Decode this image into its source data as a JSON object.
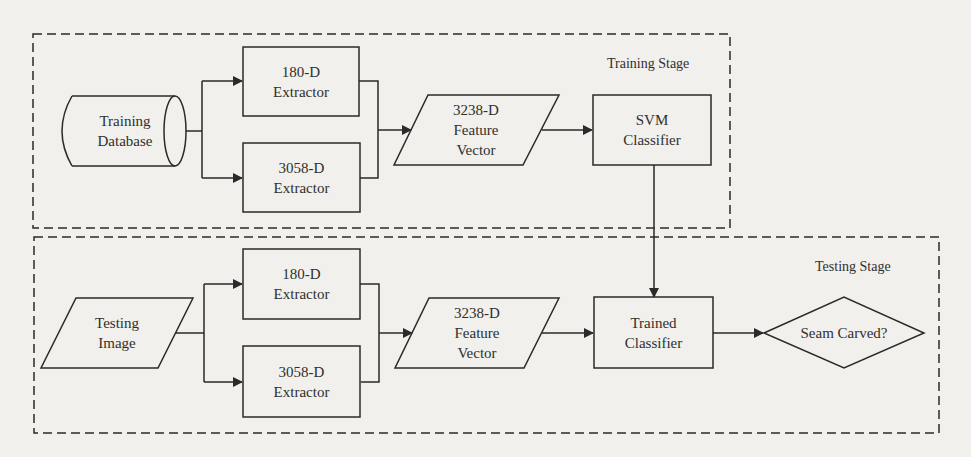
{
  "diagram": {
    "training_stage": {
      "title": "Training Stage",
      "nodes": {
        "database": {
          "line1": "Training",
          "line2": "Database",
          "shape": "cylinder"
        },
        "extractor_180": {
          "line1": "180-D",
          "line2": "Extractor",
          "shape": "rectangle"
        },
        "extractor_3058": {
          "line1": "3058-D",
          "line2": "Extractor",
          "shape": "rectangle"
        },
        "feature_vector": {
          "line1": "3238-D",
          "line2": "Feature",
          "line3": "Vector",
          "shape": "parallelogram"
        },
        "svm": {
          "line1": "SVM",
          "line2": "Classifier",
          "shape": "rectangle"
        }
      }
    },
    "testing_stage": {
      "title": "Testing Stage",
      "nodes": {
        "image": {
          "line1": "Testing",
          "line2": "Image",
          "shape": "parallelogram"
        },
        "extractor_180": {
          "line1": "180-D",
          "line2": "Extractor",
          "shape": "rectangle"
        },
        "extractor_3058": {
          "line1": "3058-D",
          "line2": "Extractor",
          "shape": "rectangle"
        },
        "feature_vector": {
          "line1": "3238-D",
          "line2": "Feature",
          "line3": "Vector",
          "shape": "parallelogram"
        },
        "trained_classifier": {
          "line1": "Trained",
          "line2": "Classifier",
          "shape": "rectangle"
        },
        "decision": {
          "line1": "Seam Carved?",
          "shape": "diamond"
        }
      }
    },
    "edges": [
      {
        "from": "Training Database",
        "to": "180-D Extractor"
      },
      {
        "from": "Training Database",
        "to": "3058-D Extractor"
      },
      {
        "from": "180-D Extractor",
        "to": "3238-D Feature Vector"
      },
      {
        "from": "3058-D Extractor",
        "to": "3238-D Feature Vector"
      },
      {
        "from": "3238-D Feature Vector",
        "to": "SVM Classifier"
      },
      {
        "from": "SVM Classifier",
        "to": "Trained Classifier"
      },
      {
        "from": "Testing Image",
        "to": "180-D Extractor"
      },
      {
        "from": "Testing Image",
        "to": "3058-D Extractor"
      },
      {
        "from": "180-D Extractor",
        "to": "3238-D Feature Vector"
      },
      {
        "from": "3058-D Extractor",
        "to": "3238-D Feature Vector"
      },
      {
        "from": "3238-D Feature Vector",
        "to": "Trained Classifier"
      },
      {
        "from": "Trained Classifier",
        "to": "Seam Carved?"
      }
    ],
    "colors": {
      "background": "#f1f0ec",
      "stroke": "#2a2a2a"
    }
  }
}
